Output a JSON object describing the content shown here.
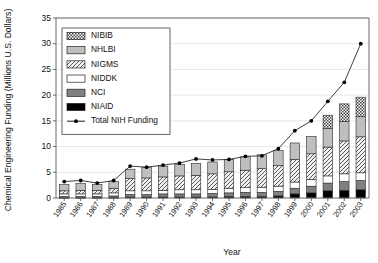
{
  "chart_data": {
    "type": "bar",
    "subtype": "stacked-bar-with-line-overlay",
    "title": "",
    "xlabel": "Year",
    "ylabel": "Chemical Engineering Funding (Millions U.S. Dollars)",
    "ylim": [
      0,
      35
    ],
    "yticks": [
      0,
      5,
      10,
      15,
      20,
      25,
      30,
      35
    ],
    "grid": false,
    "legend_position": "upper-left-inside",
    "categories": [
      "1985",
      "1986",
      "1987",
      "1988",
      "1989",
      "1990",
      "1991",
      "1992",
      "1993",
      "1994",
      "1995",
      "1996",
      "1997",
      "1998",
      "1999",
      "2000",
      "2001",
      "2002",
      "2003"
    ],
    "series": [
      {
        "name": "NIAID",
        "swatch": "solid-black",
        "color": "#000000",
        "values": [
          0.1,
          0.1,
          0.1,
          0.1,
          0.2,
          0.2,
          0.2,
          0.2,
          0.2,
          0.2,
          0.3,
          0.3,
          0.3,
          0.4,
          0.8,
          1.0,
          1.4,
          1.5,
          1.6
        ]
      },
      {
        "name": "NCI",
        "swatch": "solid-gray",
        "color": "#808080",
        "values": [
          0.2,
          0.2,
          0.2,
          0.3,
          0.5,
          0.5,
          0.6,
          0.6,
          0.6,
          0.7,
          0.7,
          0.8,
          0.8,
          0.9,
          1.1,
          1.3,
          1.5,
          1.7,
          1.8
        ]
      },
      {
        "name": "NIDDK",
        "swatch": "white",
        "color": "#ffffff",
        "values": [
          0.5,
          0.5,
          0.5,
          0.6,
          0.7,
          0.7,
          0.7,
          0.8,
          0.8,
          0.8,
          0.9,
          0.9,
          1.0,
          1.0,
          1.2,
          1.3,
          1.4,
          1.5,
          1.5
        ]
      },
      {
        "name": "NIGMS",
        "swatch": "diagonal-hatch",
        "color": "#e8e8e8",
        "values": [
          0.6,
          0.7,
          0.7,
          0.9,
          2.4,
          2.5,
          2.6,
          2.7,
          2.8,
          3.0,
          3.2,
          3.4,
          3.6,
          4.0,
          4.4,
          5.0,
          5.6,
          6.4,
          7.0
        ]
      },
      {
        "name": "NHLBI",
        "swatch": "light-gray",
        "color": "#bfbfbf",
        "values": [
          1.2,
          1.3,
          1.1,
          1.3,
          1.8,
          2.0,
          2.1,
          2.2,
          2.3,
          2.3,
          2.4,
          2.6,
          2.7,
          2.9,
          3.2,
          3.4,
          3.6,
          3.8,
          3.9
        ]
      },
      {
        "name": "NIBIB",
        "swatch": "checker-hatch",
        "color": "#f2f2f2",
        "values": [
          0,
          0,
          0,
          0,
          0,
          0,
          0,
          0,
          0,
          0,
          0,
          0,
          0,
          0,
          0,
          0,
          2.6,
          3.4,
          3.8
        ]
      }
    ],
    "line_series": {
      "name": "Total NIH Funding",
      "marker": "filled-circle",
      "color": "#000000",
      "values": [
        3.2,
        3.4,
        2.9,
        3.4,
        6.2,
        6.0,
        6.4,
        6.8,
        7.6,
        7.4,
        7.5,
        8.1,
        8.2,
        9.6,
        13.1,
        15.0,
        18.8,
        22.5,
        30.0
      ]
    }
  },
  "legend": {
    "entries": [
      {
        "label": "NIBIB"
      },
      {
        "label": "NHLBI"
      },
      {
        "label": "NIGMS"
      },
      {
        "label": "NIDDK"
      },
      {
        "label": "NCI"
      },
      {
        "label": "NIAID"
      },
      {
        "label": "Total NIH Funding"
      }
    ]
  }
}
